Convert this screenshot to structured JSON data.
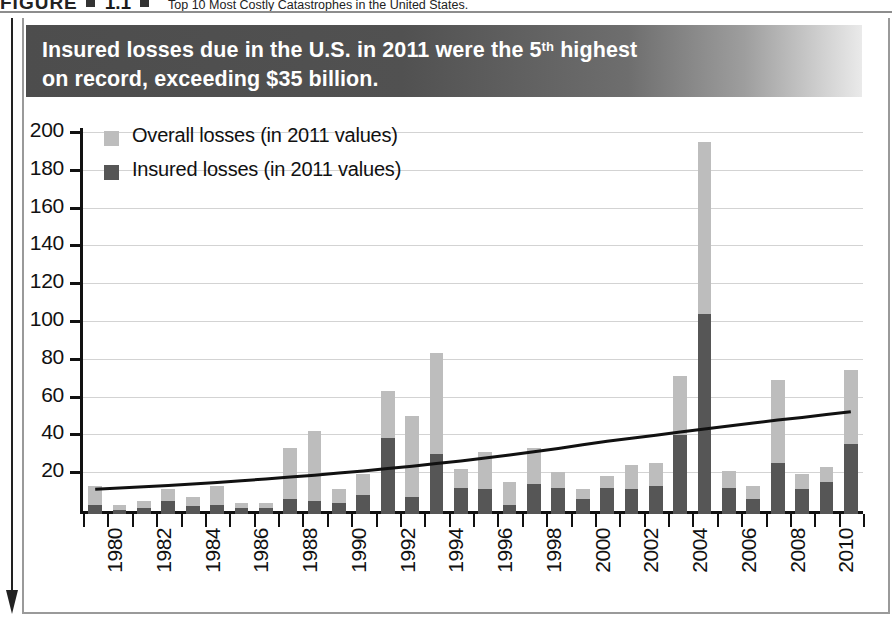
{
  "figure": {
    "label": "FIGURE",
    "number": "1.1",
    "title": "Top 10 Most Costly Catastrophes in the United States."
  },
  "banner": {
    "line1_a": "Insured losses due in the U.S. in 2011 were the 5",
    "line1_sup": "th",
    "line1_b": " highest",
    "line2": "on record, exceeding $35 billion."
  },
  "colors": {
    "overall": "#bdbdbd",
    "insured": "#565656",
    "trend_line": "#111111",
    "grid": "#d3d3d3",
    "axis": "#111111",
    "banner_dark": "#4d4d4d",
    "banner_light": "#eaeaea",
    "frame": "#9a9a9a"
  },
  "chart_data": {
    "type": "bar",
    "title": "Insured losses due in the U.S. in 2011 were the 5th highest on record, exceeding $35 billion.",
    "subtitle": "Top 10 Most Costly Catastrophes in the United States.",
    "xlabel": "",
    "ylabel": "",
    "ylim": [
      0,
      200
    ],
    "yticks": [
      20,
      40,
      60,
      80,
      100,
      120,
      140,
      160,
      180,
      200
    ],
    "grid": true,
    "legend_position": "upper-left",
    "stacked": true,
    "units": "US$ billion (in 2011 values)",
    "categories": [
      "1980",
      "1981",
      "1982",
      "1983",
      "1984",
      "1985",
      "1986",
      "1987",
      "1988",
      "1989",
      "1990",
      "1991",
      "1992",
      "1993",
      "1994",
      "1995",
      "1996",
      "1997",
      "1998",
      "1999",
      "2000",
      "2001",
      "2002",
      "2003",
      "2004",
      "2005",
      "2006",
      "2007",
      "2008",
      "2009",
      "2010",
      "2011"
    ],
    "tick_labels": [
      "1980",
      "",
      "1982",
      "",
      "1984",
      "",
      "1986",
      "",
      "1988",
      "",
      "1990",
      "",
      "1992",
      "",
      "1994",
      "",
      "1996",
      "",
      "1998",
      "",
      "2000",
      "",
      "2002",
      "",
      "2004",
      "",
      "2006",
      "",
      "2008",
      "",
      "2010",
      ""
    ],
    "series": [
      {
        "name": "Overall losses (in 2011 values)",
        "color": "#bdbdbd",
        "values": [
          15,
          5,
          7,
          13,
          9,
          15,
          6,
          6,
          35,
          44,
          13,
          21,
          65,
          52,
          85,
          24,
          33,
          17,
          35,
          22,
          13,
          20,
          26,
          27,
          73,
          197,
          23,
          15,
          71,
          21,
          25,
          76
        ]
      },
      {
        "name": "Insured losses (in 2011 values)",
        "color": "#565656",
        "values": [
          5,
          2,
          3,
          7,
          4,
          5,
          3,
          3,
          8,
          7,
          6,
          10,
          40,
          9,
          32,
          14,
          13,
          5,
          16,
          14,
          8,
          14,
          13,
          15,
          42,
          106,
          14,
          8,
          27,
          13,
          17,
          37
        ]
      }
    ],
    "trend_line": {
      "name": "trend",
      "color": "#111111",
      "x_start": "1980",
      "x_end": "2011",
      "y_start": 11,
      "y_end": 52,
      "points": [
        11,
        11.6,
        12.3,
        13.0,
        13.8,
        14.6,
        15.5,
        16.4,
        17.4,
        18.4,
        19.5,
        20.7,
        21.9,
        23.2,
        24.6,
        26.0,
        27.5,
        29.1,
        30.8,
        32.6,
        34.5,
        36.4,
        38.0,
        39.6,
        41.2,
        42.8,
        44.4,
        46.0,
        47.6,
        49.0,
        50.5,
        52
      ]
    }
  }
}
